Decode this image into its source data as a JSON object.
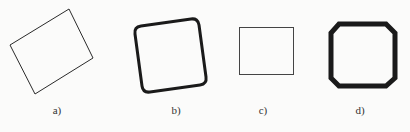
{
  "figures": [
    {
      "id": "a",
      "label": "a)",
      "shape": "rotated-rectangle",
      "points": [
        [
          69,
          9
        ],
        [
          93,
          58
        ],
        [
          35,
          94
        ],
        [
          10,
          45
        ]
      ],
      "stroke_width": 1,
      "label_pos": [
        57,
        104
      ]
    },
    {
      "id": "b",
      "label": "b)",
      "shape": "rounded-rotated-square",
      "stroke_width": 3,
      "label_pos": [
        176,
        104
      ]
    },
    {
      "id": "c",
      "label": "c)",
      "shape": "rectangle",
      "rect": [
        239,
        27,
        54,
        47
      ],
      "stroke_width": 1,
      "label_pos": [
        263,
        104
      ]
    },
    {
      "id": "d",
      "label": "d)",
      "shape": "octagon",
      "stroke_width": 5,
      "label_pos": [
        360,
        104
      ]
    }
  ],
  "colors": {
    "stroke": "#1a1a1a",
    "background": "#fbfbfa"
  }
}
